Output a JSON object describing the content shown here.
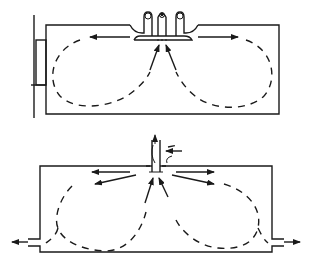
{
  "figure": {
    "panels": [
      {
        "id": "top",
        "description": "ceiling-mounted supply diffuser with twin recirculation loops"
      },
      {
        "id": "bottom",
        "description": "roof jet inlet with side outlets and twin recirculation loops"
      }
    ],
    "colors": {
      "line": "#1a1a1a",
      "background": "#ffffff"
    }
  }
}
